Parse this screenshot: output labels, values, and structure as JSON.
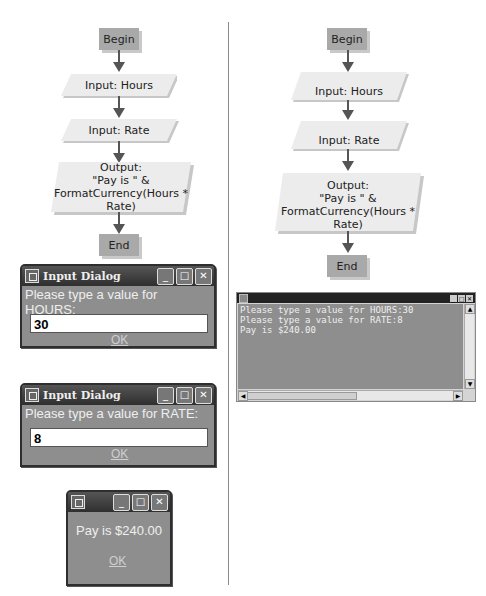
{
  "left_flowchart": {
    "begin": "Begin",
    "input_hours": "Input: Hours",
    "input_rate": "Input: Rate",
    "output_lines": [
      "Output:",
      "\"Pay is \" &",
      "FormatCurrency(Hours * Rate)"
    ],
    "end": "End"
  },
  "right_flowchart": {
    "begin": "Begin",
    "input_hours": "Input: Hours",
    "input_rate": "Input: Rate",
    "output_lines": [
      "Output:",
      "\"Pay is \" &",
      "FormatCurrency(Hours * Rate)"
    ],
    "end": "End"
  },
  "dialog_hours": {
    "title": "Input Dialog",
    "prompt": "Please type a value for HOURS:",
    "value": "30",
    "ok_label": "OK"
  },
  "dialog_rate": {
    "title": "Input Dialog",
    "prompt": "Please type a value for RATE:",
    "value": "8",
    "ok_label": "OK"
  },
  "dialog_result": {
    "message": "Pay is $240.00",
    "ok_label": "OK"
  },
  "window_buttons": {
    "minimize": "_",
    "maximize": "□",
    "close": "✕"
  },
  "console": {
    "lines": [
      "Please type a value for HOURS:30",
      "Please type a value for RATE:8",
      "Pay is $240.00"
    ]
  }
}
